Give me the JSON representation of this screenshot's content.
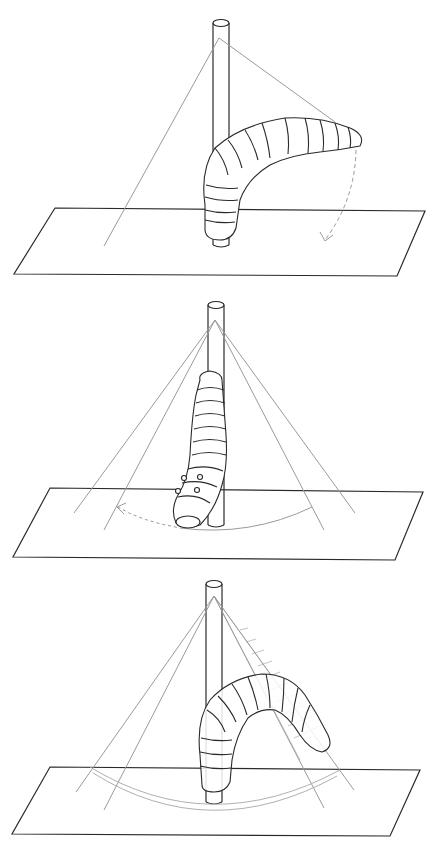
{
  "figure": {
    "colors": {
      "ink": "#2a2a2a",
      "guide_line": "#9a9a9a",
      "arc": "#b0b0b0",
      "background": "#ffffff"
    },
    "panels": [
      {
        "id": "panel-1",
        "pose": "caterpillar arched horizontally outward from pole",
        "arrow": "dashed curved arrow downward to plane"
      },
      {
        "id": "panel-2",
        "pose": "caterpillar hanging vertically down along pole, head near plane",
        "arrow": "dashed arc arrow sweeping left across plane"
      },
      {
        "id": "panel-3",
        "pose": "caterpillar arched to the right with hatched shadow fan",
        "arrow": "double arc on plane"
      }
    ]
  }
}
